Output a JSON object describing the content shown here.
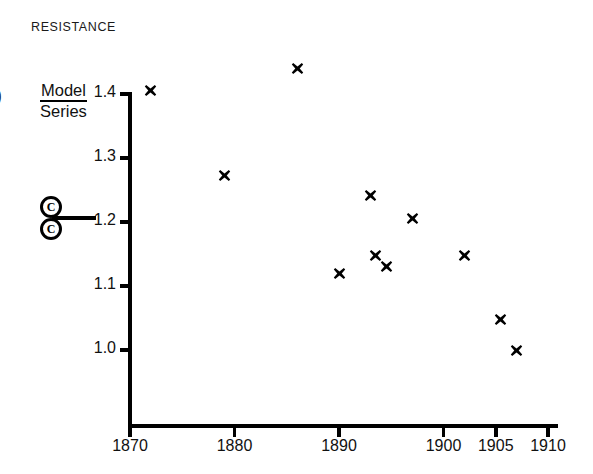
{
  "figure": {
    "title": "RESISTANCE",
    "edge_mark": ")",
    "axis_label": {
      "numerator": "Model",
      "denominator": "Series"
    },
    "symbol": {
      "name": "double-circled-c-with-rule",
      "top_glyph": "C",
      "bottom_glyph": "C"
    }
  },
  "chart_data": {
    "type": "scatter",
    "title": "RESISTANCE",
    "xlabel": "",
    "ylabel": "Model / Series",
    "xlim": [
      1868,
      1911
    ],
    "ylim": [
      0.955,
      1.455
    ],
    "grid": false,
    "legend": "none",
    "marker": "x",
    "marker_color": "#000000",
    "xticks": [
      1870,
      1880,
      1890,
      1900,
      1905,
      1910
    ],
    "xtick_labels": [
      "1870",
      "1880",
      "1890",
      "1900",
      "1905",
      "1910"
    ],
    "yticks": [
      1.0,
      1.1,
      1.2,
      1.3,
      1.4
    ],
    "ytick_labels": [
      "1.0",
      "1.1",
      "1.2",
      "1.3",
      "1.4"
    ],
    "points": [
      {
        "x": 1872,
        "y": 1.405
      },
      {
        "x": 1879,
        "y": 1.273
      },
      {
        "x": 1886,
        "y": 1.44
      },
      {
        "x": 1890,
        "y": 1.12
      },
      {
        "x": 1893,
        "y": 1.242
      },
      {
        "x": 1893.5,
        "y": 1.147
      },
      {
        "x": 1894.5,
        "y": 1.131
      },
      {
        "x": 1897,
        "y": 1.205
      },
      {
        "x": 1902,
        "y": 1.147
      },
      {
        "x": 1905.5,
        "y": 1.047
      },
      {
        "x": 1907,
        "y": 1.0
      }
    ]
  }
}
